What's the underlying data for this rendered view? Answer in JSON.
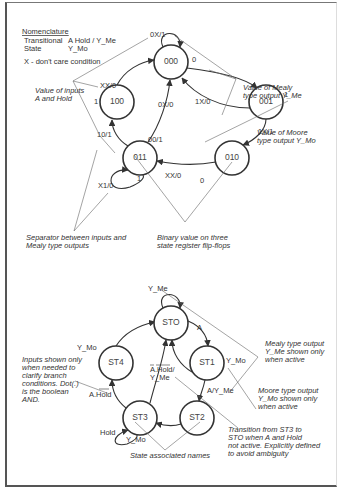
{
  "legend": {
    "title": "Nomenclature",
    "transitional_label": "Transitional",
    "transitional_value": "A  Hold / Y_Me",
    "state_label": "State",
    "state_value": "Y_Mo",
    "dont_care": "X - don't care condition"
  },
  "diagram1": {
    "states": [
      {
        "id": "000",
        "label": "000",
        "moore": "0"
      },
      {
        "id": "001",
        "label": "001",
        "moore": "1"
      },
      {
        "id": "010",
        "label": "010",
        "moore": "0"
      },
      {
        "id": "011",
        "label": "011",
        "moore": "1"
      },
      {
        "id": "100",
        "label": "100",
        "moore": "1"
      }
    ],
    "transitions": [
      {
        "from": "000",
        "to": "000",
        "label": "0X/1"
      },
      {
        "from": "000",
        "to": "001",
        "label": "1X/0"
      },
      {
        "from": "001",
        "to": "000",
        "label": "0X/0"
      },
      {
        "from": "001",
        "to": "010",
        "label": "1X/1"
      },
      {
        "from": "010",
        "to": "011",
        "label": "XX/0"
      },
      {
        "from": "011",
        "to": "011",
        "label": "X1/0"
      },
      {
        "from": "011",
        "to": "000",
        "label": "00/1"
      },
      {
        "from": "011",
        "to": "100",
        "label": "10/1"
      },
      {
        "from": "100",
        "to": "000",
        "label": "XX/0"
      }
    ],
    "annotations": {
      "inputs": [
        "Value of inputs",
        "A and Hold"
      ],
      "mealy": [
        "Value of Mealy",
        "type output Y_Me"
      ],
      "moore": [
        "Value of Moore",
        "type output Y_Mo"
      ],
      "separator": [
        "Separator between inputs and",
        "Mealy type outputs"
      ],
      "binary": [
        "Binary value on three",
        "state register flip-flops"
      ]
    }
  },
  "diagram2": {
    "states": [
      {
        "id": "STO",
        "label": "STO"
      },
      {
        "id": "ST1",
        "label": "ST1",
        "moore": "Y_Mo"
      },
      {
        "id": "ST2",
        "label": "ST2"
      },
      {
        "id": "ST3",
        "label": "ST3",
        "moore": "Y_Mo"
      },
      {
        "id": "ST4",
        "label": "ST4",
        "moore": "Y_Mo"
      }
    ],
    "transitions": [
      {
        "from": "STO",
        "to": "STO",
        "label": "Y_Me"
      },
      {
        "from": "STO",
        "to": "ST1",
        "label": "A"
      },
      {
        "from": "ST1",
        "to": "STO",
        "label": ""
      },
      {
        "from": "ST1",
        "to": "ST2",
        "label": "A/Y_Me"
      },
      {
        "from": "ST2",
        "to": "ST3",
        "label": ""
      },
      {
        "from": "ST3",
        "to": "ST3",
        "label": "Hold"
      },
      {
        "from": "ST3",
        "to": "STO",
        "label": "A.Hold/ Y_Me"
      },
      {
        "from": "ST3",
        "to": "ST4",
        "label": "A.Hold"
      },
      {
        "from": "ST4",
        "to": "STO",
        "label": ""
      }
    ],
    "labels": {
      "sto_self": "Y_Me",
      "sto_st1": "A",
      "st1_moore": "Y_Mo",
      "st1_st2": "A/Y_Me",
      "st4_moore": "Y_Mo",
      "st3_st4": "A.Hold",
      "st3_sto_1": "A.Hold/",
      "st3_sto_2": "Y_Me",
      "st3_hold": "Hold",
      "st3_moore": "Y_Mo"
    },
    "annotations": {
      "inputs": [
        "Inputs shown only",
        "when needed to",
        "clarify branch",
        "conditions. Dot(.)",
        "is the boolean",
        "AND."
      ],
      "mealy": [
        "Mealy type output",
        "Y_Me shown only",
        "when active"
      ],
      "moore": [
        "Moore type output",
        "Y_Mo shown only",
        "when active"
      ],
      "transition": [
        "Transition from ST3 to",
        "STO when A and Hold",
        "not active. Explicitly defined",
        "to avoid ambiguity"
      ],
      "names": "State associated names"
    }
  }
}
